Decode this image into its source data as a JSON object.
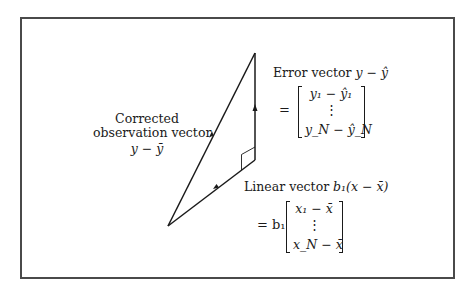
{
  "figure": {
    "type": "vector-decomposition-triangle",
    "stroke_color": "#1a1a1a",
    "frame_color": "#4a4a4a",
    "vertices": {
      "origin": [
        168,
        226
      ],
      "apex": [
        255,
        53
      ],
      "right_angle": [
        255,
        160
      ]
    },
    "arrows": [
      {
        "name": "corrected-observation-vector",
        "from": "origin",
        "to": "apex"
      },
      {
        "name": "linear-vector",
        "from": "origin",
        "to": "right_angle"
      },
      {
        "name": "error-vector",
        "from": "right_angle",
        "to": "apex"
      }
    ]
  },
  "labels": {
    "corrected": {
      "line1": "Corrected",
      "line2": "observation vector",
      "expr": "y − ȳ"
    },
    "error": {
      "title": "Error vector ",
      "title_expr": "y − ŷ",
      "equals": "=",
      "row_first": "y₁ − ŷ₁",
      "row_dots": "⋮",
      "row_last": "y_N − ŷ_N"
    },
    "linear": {
      "title": "Linear vector ",
      "title_expr": "b₁(x − x̄)",
      "equals": "= b₁",
      "row_first": "x₁ − x̄",
      "row_dots": "⋮",
      "row_last": "x_N − x̄"
    }
  }
}
